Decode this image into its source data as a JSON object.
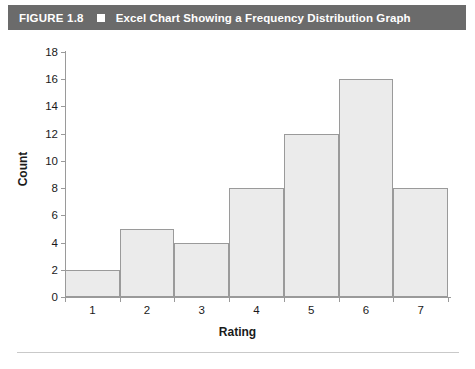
{
  "figure": {
    "number_label": "FIGURE 1.8",
    "separator_icon": "filled-square-icon",
    "title": "Excel Chart Showing a Frequency Distribution Graph"
  },
  "chart_data": {
    "type": "bar",
    "title": "Excel Chart Showing a Frequency Distribution Graph",
    "xlabel": "Rating",
    "ylabel": "Count",
    "categories": [
      "1",
      "2",
      "3",
      "4",
      "5",
      "6",
      "7"
    ],
    "values": [
      2,
      5,
      4,
      8,
      12,
      16,
      8
    ],
    "ylim": [
      0,
      18
    ],
    "y_ticks": [
      0,
      2,
      4,
      6,
      8,
      10,
      12,
      14,
      16,
      18
    ],
    "y_tick_labels": [
      "0",
      "2",
      "4",
      "6",
      "8",
      "10",
      "12",
      "14",
      "16",
      "18"
    ],
    "x_tick_labels": [
      "1",
      "2",
      "3",
      "4",
      "5",
      "6",
      "7"
    ],
    "grid": false,
    "legend": false,
    "bar_fill_color": "#ebebeb",
    "bar_border_color": "#9a9a9a",
    "axis_color": "#9a9a9a",
    "header_background_color": "#6b6b6b",
    "header_text_color": "#ffffff"
  }
}
